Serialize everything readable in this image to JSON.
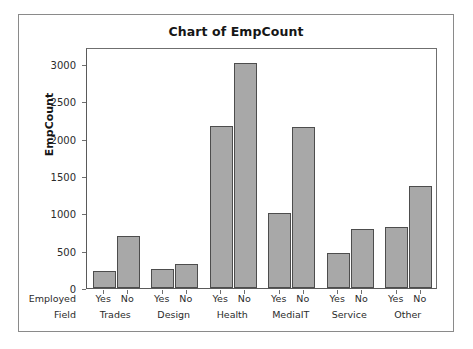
{
  "window": {
    "frame_color": "#8a8a8a"
  },
  "chart_data": {
    "type": "bar",
    "title": "Chart of EmpCount",
    "xlabel": "",
    "ylabel": "EmpCount",
    "ylim": [
      0,
      3000
    ],
    "ytick_labels": [
      "3000",
      "2500",
      "2000",
      "1500",
      "1000",
      "500",
      "0"
    ],
    "ytick_values": [
      3000,
      2500,
      2000,
      1500,
      1000,
      500,
      0
    ],
    "grid": false,
    "legend": "none",
    "bar_color": "#a8a8a8",
    "bar_edge_color": "#4d4d4d",
    "axis_captions": [
      "Employed",
      "Field"
    ],
    "inner_category_label": "Employed",
    "outer_category_label": "Field",
    "categories": [
      "Trades",
      "Design",
      "Health",
      "MediaIT",
      "Service",
      "Other"
    ],
    "subcategories": [
      "Yes",
      "No"
    ],
    "series": [
      {
        "name": "Yes",
        "values": [
          230,
          250,
          2175,
          1000,
          470,
          820
        ]
      },
      {
        "name": "No",
        "values": [
          700,
          315,
          3010,
          2160,
          790,
          1370
        ]
      }
    ],
    "groups": [
      {
        "label": "Trades",
        "bars": [
          {
            "sub": "Yes",
            "value": 230
          },
          {
            "sub": "No",
            "value": 700
          }
        ]
      },
      {
        "label": "Design",
        "bars": [
          {
            "sub": "Yes",
            "value": 250
          },
          {
            "sub": "No",
            "value": 315
          }
        ]
      },
      {
        "label": "Health",
        "bars": [
          {
            "sub": "Yes",
            "value": 2175
          },
          {
            "sub": "No",
            "value": 3010
          }
        ]
      },
      {
        "label": "MediaIT",
        "bars": [
          {
            "sub": "Yes",
            "value": 1000
          },
          {
            "sub": "No",
            "value": 2160
          }
        ]
      },
      {
        "label": "Service",
        "bars": [
          {
            "sub": "Yes",
            "value": 470
          },
          {
            "sub": "No",
            "value": 790
          }
        ]
      },
      {
        "label": "Other",
        "bars": [
          {
            "sub": "Yes",
            "value": 820
          },
          {
            "sub": "No",
            "value": 1370
          }
        ]
      }
    ]
  }
}
